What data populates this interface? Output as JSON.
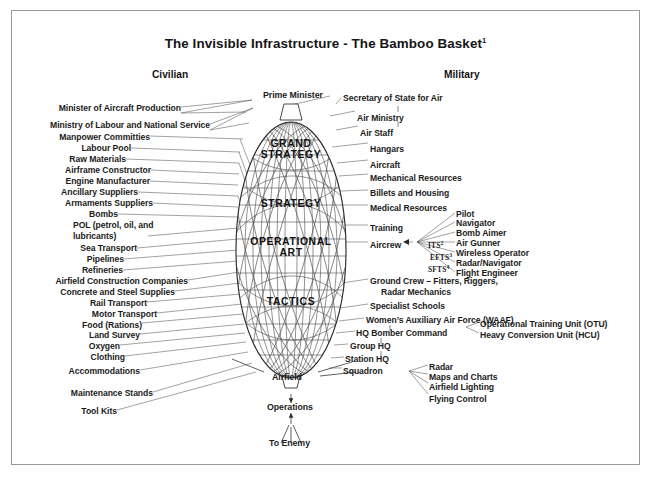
{
  "document": {
    "title": "The Invisible Infrastructure - The Bamboo Basket",
    "title_footnote": "1"
  },
  "columns": {
    "left_header": "Civilian",
    "right_header": "Military"
  },
  "basket": {
    "apex_label": "Prime Minister",
    "bands": [
      {
        "id": "grand-strategy",
        "line1": "GRAND",
        "line2": "STRATEGY"
      },
      {
        "id": "strategy",
        "line1": "STRATEGY",
        "line2": ""
      },
      {
        "id": "operational-art",
        "line1": "OPERATIONAL",
        "line2": "ART"
      },
      {
        "id": "tactics",
        "line1": "TACTICS",
        "line2": ""
      }
    ]
  },
  "bottom_chain": {
    "airfield": "Airfield",
    "operations": "Operations",
    "to_enemy": "To Enemy"
  },
  "civilian_items": [
    {
      "label": "Minister of Aircraft Production"
    },
    {
      "label": "Ministry of Labour and National Service"
    },
    {
      "label": "Manpower Committies"
    },
    {
      "label": "Labour Pool"
    },
    {
      "label": "Raw Materials"
    },
    {
      "label": "Airframe Constructor"
    },
    {
      "label": "Engine Manufacturer"
    },
    {
      "label": "Ancillary Suppliers"
    },
    {
      "label": "Armaments Suppliers"
    },
    {
      "label": "Bombs"
    },
    {
      "label": "POL (petrol, oil, and"
    },
    {
      "label": "lubricants)"
    },
    {
      "label": "Sea Transport"
    },
    {
      "label": "Pipelines"
    },
    {
      "label": "Refineries"
    },
    {
      "label": "Airfield Construction Companies"
    },
    {
      "label": "Concrete and Steel Supplies"
    },
    {
      "label": "Rail Transport"
    },
    {
      "label": "Motor Transport"
    },
    {
      "label": "Food (Rations)"
    },
    {
      "label": "Land Survey"
    },
    {
      "label": "Oxygen"
    },
    {
      "label": "Clothing"
    },
    {
      "label": "Accommodations"
    },
    {
      "label": "Maintenance Stands"
    },
    {
      "label": "Tool Kits"
    }
  ],
  "military_items": [
    {
      "label": "Secretary of State for Air"
    },
    {
      "label": "Air Ministry"
    },
    {
      "label": "Air Staff"
    },
    {
      "label": "Hangars"
    },
    {
      "label": "Aircraft"
    },
    {
      "label": "Mechanical Resources"
    },
    {
      "label": "Billets and Housing"
    },
    {
      "label": "Medical Resources"
    },
    {
      "label": "Training"
    },
    {
      "label": "Aircrew"
    },
    {
      "label": "Ground Crew – Fitters, Riggers,"
    },
    {
      "label": "Radar Mechanics"
    },
    {
      "label": "Specialist Schools"
    },
    {
      "label": "Women’s Auxiliary Air Force (WAAF)"
    },
    {
      "label": "HQ Bomber Command"
    },
    {
      "label": "Group HQ"
    },
    {
      "label": "Station HQ"
    },
    {
      "label": "Squadron"
    }
  ],
  "aircrew_branches": [
    {
      "label": "Pilot"
    },
    {
      "label": "Navigator"
    },
    {
      "label": "Bomb Aimer"
    },
    {
      "label": "Air Gunner"
    },
    {
      "label": "Wireless Operator"
    },
    {
      "label": "Radar/Navigator"
    },
    {
      "label": "Flight Engineer"
    }
  ],
  "aircrew_abbreviations": [
    {
      "text": "ITS",
      "footnote": "2"
    },
    {
      "text": "EFTS",
      "footnote": "3"
    },
    {
      "text": "SFTS",
      "footnote": "4"
    }
  ],
  "bomber_command_branches": [
    {
      "label": "Operational Training Unit (OTU)"
    },
    {
      "label": "Heavy Conversion Unit (HCU)"
    }
  ],
  "squadron_branches": [
    {
      "label": "Radar"
    },
    {
      "label": "Maps and Charts"
    },
    {
      "label": "Airfield Lighting"
    },
    {
      "label": "Flying Control"
    }
  ],
  "colors": {
    "ink": "#1b1b1b",
    "line": "#4d4d4d",
    "frame": "#9a9a9a",
    "background": "#ffffff"
  }
}
